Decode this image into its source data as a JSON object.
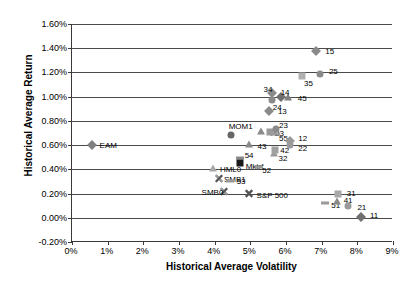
{
  "chart_data": {
    "type": "scatter",
    "title": "",
    "xlabel": "Historical Average Volatility",
    "ylabel": "Historical Average Return",
    "xlim": [
      0,
      9
    ],
    "ylim": [
      -0.2,
      1.6
    ],
    "xtick_labels": [
      "0%",
      "1%",
      "2%",
      "3%",
      "4%",
      "5%",
      "6%",
      "7%",
      "8%",
      "9%"
    ],
    "xtick_values": [
      0,
      1,
      2,
      3,
      4,
      5,
      6,
      7,
      8,
      9
    ],
    "ytick_labels": [
      "1.60%",
      "1.40%",
      "1.20%",
      "1.00%",
      "0.80%",
      "0.60%",
      "0.40%",
      "0.20%",
      "0.00%",
      "-0.20%"
    ],
    "ytick_values": [
      1.6,
      1.4,
      1.2,
      1.0,
      0.8,
      0.6,
      0.4,
      0.2,
      0.0,
      -0.2
    ],
    "grid": "horizontal",
    "legend": "none",
    "units": "percent",
    "points": [
      {
        "label": "EAM",
        "x": 0.55,
        "y": 0.6,
        "marker": "diamond",
        "color": "#808080",
        "label_dx": 8,
        "label_dy": 0
      },
      {
        "label": "15",
        "x": 6.85,
        "y": 1.38,
        "marker": "diamond",
        "color": "#8a8a8a",
        "label_dx": 9,
        "label_dy": 0
      },
      {
        "label": "25",
        "x": 6.95,
        "y": 1.19,
        "marker": "circle",
        "color": "#8a8a8a",
        "label_dx": 9,
        "label_dy": -3
      },
      {
        "label": "35",
        "x": 6.45,
        "y": 1.17,
        "marker": "square",
        "color": "#b0b0b0",
        "label_dx": 2,
        "label_dy": 7
      },
      {
        "label": "45",
        "x": 6.05,
        "y": 0.99,
        "marker": "triangle",
        "color": "#7f7f7f",
        "label_dx": 10,
        "label_dy": 0
      },
      {
        "label": "14",
        "x": 5.85,
        "y": 1.0,
        "marker": "diamond",
        "color": "#6f6f6f",
        "label_dx": 0,
        "label_dy": -5
      },
      {
        "label": "24",
        "x": 5.6,
        "y": 0.97,
        "marker": "circle",
        "color": "#8a8a8a",
        "label_dx": 1,
        "label_dy": 7
      },
      {
        "label": "34",
        "x": 5.62,
        "y": 1.03,
        "marker": "diamond",
        "color": "#8a8a8a",
        "label_dx": -9,
        "label_dy": -4
      },
      {
        "label": "13",
        "x": 5.52,
        "y": 0.88,
        "marker": "diamond",
        "color": "#8a8a8a",
        "label_dx": 9,
        "label_dy": 0
      },
      {
        "label": "MOM1",
        "x": 4.45,
        "y": 0.68,
        "marker": "circle",
        "color": "#666666",
        "label_dx": -2,
        "label_dy": -9
      },
      {
        "label": "44",
        "x": 5.3,
        "y": 0.71,
        "marker": "triangle",
        "color": "#8a8a8a",
        "label_dx": 7,
        "label_dy": 1
      },
      {
        "label": "33",
        "x": 5.55,
        "y": 0.71,
        "marker": "square",
        "color": "#9a9a9a",
        "label_dx": 5,
        "label_dy": 1
      },
      {
        "label": "23",
        "x": 5.72,
        "y": 0.73,
        "marker": "circle",
        "color": "#8a8a8a",
        "label_dx": 3,
        "label_dy": -4
      },
      {
        "label": "55",
        "x": 5.72,
        "y": 0.69,
        "marker": "dash",
        "color": "#9a9a9a",
        "label_dx": 3,
        "label_dy": 4
      },
      {
        "label": "12",
        "x": 6.12,
        "y": 0.63,
        "marker": "diamond",
        "color": "#9a9a9a",
        "label_dx": 8,
        "label_dy": -3
      },
      {
        "label": "22",
        "x": 6.12,
        "y": 0.6,
        "marker": "circle",
        "color": "#9a9a9a",
        "label_dx": 8,
        "label_dy": 3
      },
      {
        "label": "43",
        "x": 4.95,
        "y": 0.6,
        "marker": "triangle",
        "color": "#8a8a8a",
        "label_dx": 9,
        "label_dy": 1
      },
      {
        "label": "32",
        "x": 5.65,
        "y": 0.53,
        "marker": "triangle",
        "color": "#9a9a9a",
        "label_dx": 5,
        "label_dy": 4
      },
      {
        "label": "42",
        "x": 5.7,
        "y": 0.56,
        "marker": "square",
        "color": "#a0a0a0",
        "label_dx": 5,
        "label_dy": 0
      },
      {
        "label": "54",
        "x": 4.7,
        "y": 0.49,
        "marker": "dash",
        "color": "#8a8a8a",
        "label_dx": 5,
        "label_dy": -3
      },
      {
        "label": "Mktrf",
        "x": 4.7,
        "y": 0.45,
        "marker": "square",
        "color": "#1a1a1a",
        "label_dx": 6,
        "label_dy": 3
      },
      {
        "label": "52",
        "x": 5.25,
        "y": 0.42,
        "marker": "dash",
        "color": "#9a9a9a",
        "label_dx": 3,
        "label_dy": 3
      },
      {
        "label": "HML0",
        "x": 3.95,
        "y": 0.4,
        "marker": "triangle",
        "color": "#a8a8a8",
        "label_dx": 7,
        "label_dy": 0
      },
      {
        "label": "SMB1",
        "x": 4.12,
        "y": 0.32,
        "marker": "cross",
        "color": "#9a9a9a",
        "label_dx": 5,
        "label_dy": 0
      },
      {
        "label": "53",
        "x": 4.42,
        "y": 0.3,
        "marker": "dash",
        "color": "#9a9a9a",
        "label_dx": 7,
        "label_dy": 0
      },
      {
        "label": "SMB0",
        "x": 4.25,
        "y": 0.21,
        "marker": "cross",
        "color": "#9a9a9a",
        "label_dx": -22,
        "label_dy": 0
      },
      {
        "label": "S&P 500",
        "x": 4.95,
        "y": 0.2,
        "marker": "cross",
        "color": "#555555",
        "label_dx": 8,
        "label_dy": 1
      },
      {
        "label": "31",
        "x": 7.45,
        "y": 0.2,
        "marker": "square",
        "color": "#a8a8a8",
        "label_dx": 9,
        "label_dy": -1
      },
      {
        "label": "51",
        "x": 7.1,
        "y": 0.12,
        "marker": "dash",
        "color": "#9a9a9a",
        "label_dx": 6,
        "label_dy": 2
      },
      {
        "label": "41",
        "x": 7.42,
        "y": 0.13,
        "marker": "triangle",
        "color": "#8a8a8a",
        "label_dx": 7,
        "label_dy": -2
      },
      {
        "label": "21",
        "x": 7.75,
        "y": 0.1,
        "marker": "circle",
        "color": "#9a9a9a",
        "label_dx": 9,
        "label_dy": 1
      },
      {
        "label": "11",
        "x": 8.1,
        "y": 0.01,
        "marker": "diamond",
        "color": "#6f6f6f",
        "label_dx": 9,
        "label_dy": -2
      }
    ]
  }
}
